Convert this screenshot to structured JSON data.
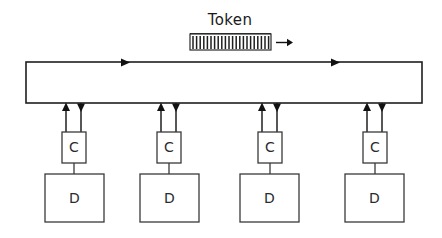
{
  "diagram": {
    "type": "token-ring-network",
    "background_color": "#ffffff",
    "line_color": "#1f1f1f",
    "box_fill": "#ffffff",
    "token": {
      "label": "Token",
      "direction_arrow": "right-arrow-icon",
      "hatch_bars": 22,
      "x": 190,
      "y": 34,
      "width": 81,
      "height": 16
    },
    "ring": {
      "name": "ring-bus",
      "x": 26,
      "y": 62,
      "width": 396,
      "height": 41,
      "flow_direction": "clockwise",
      "top_arrow_positions": [
        126,
        336
      ]
    },
    "stations": [
      {
        "controller_label": "C",
        "device_label": "D",
        "controller_x": 62,
        "controller_y": 132,
        "controller_width": 24,
        "controller_height": 31,
        "device_x": 45,
        "device_y": 174,
        "device_width": 59,
        "device_height": 48,
        "uplink_x": 66,
        "downlink_x": 81
      },
      {
        "controller_label": "C",
        "device_label": "D",
        "controller_x": 157,
        "controller_y": 132,
        "controller_width": 24,
        "controller_height": 31,
        "device_x": 140,
        "device_y": 174,
        "device_width": 59,
        "device_height": 48,
        "uplink_x": 161,
        "downlink_x": 176
      },
      {
        "controller_label": "C",
        "device_label": "D",
        "controller_x": 258,
        "controller_y": 132,
        "controller_width": 24,
        "controller_height": 31,
        "device_x": 240,
        "device_y": 174,
        "device_width": 59,
        "device_height": 48,
        "uplink_x": 262,
        "downlink_x": 277
      },
      {
        "controller_label": "C",
        "device_label": "D",
        "controller_x": 363,
        "controller_y": 132,
        "controller_width": 24,
        "controller_height": 31,
        "device_x": 345,
        "device_y": 174,
        "device_width": 59,
        "device_height": 48,
        "uplink_x": 367,
        "downlink_x": 382
      }
    ]
  }
}
